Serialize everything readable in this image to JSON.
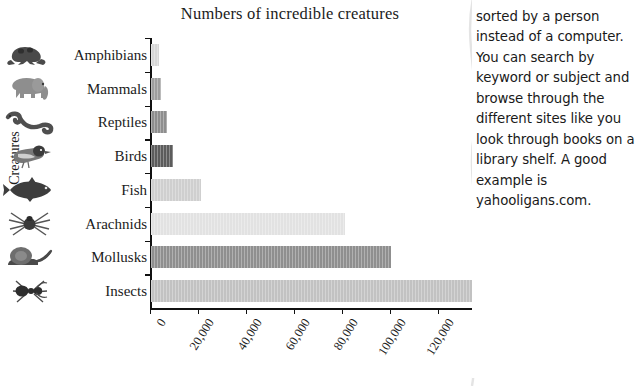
{
  "chart_data": {
    "type": "bar",
    "orientation": "horizontal",
    "title": "Numbers of incredible creatures",
    "xlabel": "",
    "ylabel": "Creatures",
    "categories": [
      "Amphibians",
      "Mammals",
      "Reptiles",
      "Birds",
      "Fish",
      "Arachnids",
      "Mollusks",
      "Insects"
    ],
    "values": [
      3500,
      4000,
      6500,
      9000,
      21000,
      81000,
      100000,
      1000000
    ],
    "icons": [
      "frog-icon",
      "elephant-icon",
      "snake-icon",
      "bird-icon",
      "fish-icon",
      "spider-icon",
      "snail-icon",
      "ant-icon"
    ],
    "bar_colors": [
      "#d7d7d7",
      "#9e9e9e",
      "#8e8e8e",
      "#5c5c5c",
      "#cfcfcf",
      "#e2e2e2",
      "#8f8f8f",
      "#c2c2c2"
    ],
    "xticks": [
      "0",
      "20,000",
      "40,000",
      "60,000",
      "80,000",
      "100,000",
      "120,000",
      "140,000",
      "160,000",
      "180,000",
      "1,000,000"
    ],
    "xtick_values": [
      0,
      20000,
      40000,
      60000,
      80000,
      100000,
      120000,
      140000,
      160000,
      180000,
      1000000
    ],
    "xlim": [
      0,
      200000
    ],
    "axis_break": "//",
    "axis_arrow": "arrow-right-icon",
    "grid": false,
    "legend": "none"
  },
  "sidebar_panel": {
    "paragraph": "websites that have been sorted by a person instead of a computer. You can search by keyword or subject and browse through the different sites like you look through books on a library shelf. A good example is yahooligans.com."
  }
}
